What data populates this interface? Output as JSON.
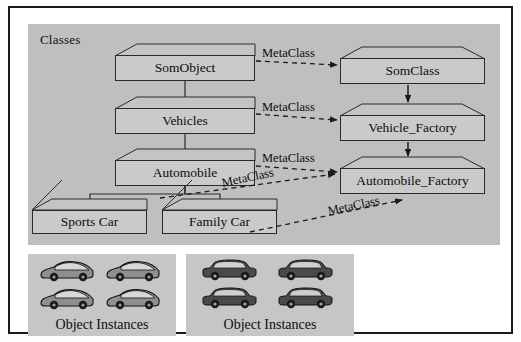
{
  "diagram": {
    "title_panel_classes": "Classes",
    "relation_label": "MetaClass",
    "object_instances_caption": "Object Instances"
  },
  "classes_panel": {
    "label": "Classes",
    "left_column": [
      {
        "name": "SomObject"
      },
      {
        "name": "Vehicles"
      },
      {
        "name": "Automobile"
      }
    ],
    "subclasses": [
      {
        "name": "Sports Car"
      },
      {
        "name": "Family Car"
      }
    ],
    "right_column": [
      {
        "name": "SomClass"
      },
      {
        "name": "Vehicle_Factory"
      },
      {
        "name": "Automobile_Factory"
      }
    ],
    "meta_links": [
      {
        "label": "MetaClass",
        "from": "SomObject",
        "to": "SomClass"
      },
      {
        "label": "MetaClass",
        "from": "Vehicles",
        "to": "Vehicle_Factory"
      },
      {
        "label": "MetaClass",
        "from": "Automobile",
        "to": "Automobile_Factory"
      },
      {
        "label": "MetaClass",
        "from": "Family Car",
        "to": "Automobile_Factory"
      },
      {
        "label": "MetaClass",
        "from": "Family Car",
        "to": "Automobile_Factory"
      }
    ]
  },
  "instances_left": {
    "caption": "Object Instances",
    "icon": "sports-car-icon",
    "count": 4
  },
  "instances_right": {
    "caption": "Object Instances",
    "icon": "sedan-car-icon",
    "count": 4
  },
  "colors": {
    "panel_gray": "#bfbfbf",
    "box_gray": "#cacaca",
    "line": "#2a2a2a",
    "text": "#0d0d0d",
    "page": "#ffffff"
  }
}
